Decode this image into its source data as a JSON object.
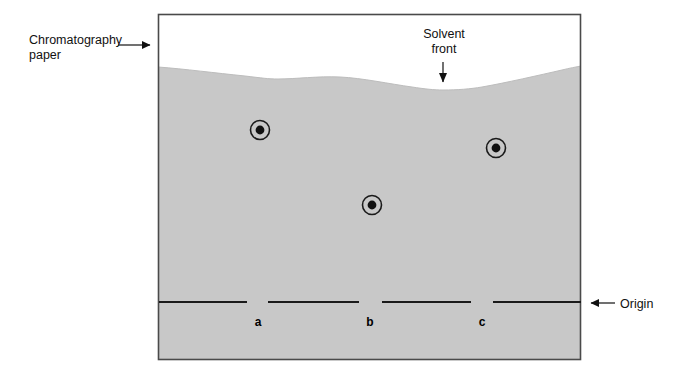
{
  "figure": {
    "type": "diagram",
    "canvas": {
      "width": 681,
      "height": 378,
      "background": "#ffffff"
    },
    "paper": {
      "name": "Chromatography paper",
      "frame": {
        "x": 158,
        "y": 14,
        "width": 423,
        "height": 346
      },
      "border_color": "#4a4a4a",
      "dry_color": "#ffffff",
      "wet_color": "#c8c8c8"
    },
    "solvent_front": {
      "label": "Solvent front",
      "description": "Wavy grey boundary marking how far the solvent travelled up the paper",
      "curve_points": [
        {
          "x": 158,
          "y": 67
        },
        {
          "x": 200,
          "y": 71
        },
        {
          "x": 245,
          "y": 76
        },
        {
          "x": 275,
          "y": 79
        },
        {
          "x": 310,
          "y": 77
        },
        {
          "x": 340,
          "y": 77
        },
        {
          "x": 375,
          "y": 81
        },
        {
          "x": 410,
          "y": 87
        },
        {
          "x": 443,
          "y": 90
        },
        {
          "x": 480,
          "y": 88
        },
        {
          "x": 520,
          "y": 80
        },
        {
          "x": 555,
          "y": 72
        },
        {
          "x": 581,
          "y": 67
        }
      ]
    },
    "origin": {
      "label": "Origin",
      "description": "Pencil baseline where the samples were spotted",
      "y": 302,
      "color": "#1a1a1a",
      "segments": [
        {
          "x1": 159,
          "x2": 247
        },
        {
          "x1": 268,
          "x2": 359
        },
        {
          "x1": 382,
          "x2": 471
        },
        {
          "x1": 493,
          "x2": 581
        }
      ]
    },
    "spots": [
      {
        "lane": "a",
        "cx": 260,
        "cy": 130,
        "outer_radius": 10,
        "inner_radius": 4.5
      },
      {
        "lane": "b",
        "cx": 372,
        "cy": 205,
        "outer_radius": 10,
        "inner_radius": 4.5
      },
      {
        "lane": "c",
        "cx": 496,
        "cy": 148,
        "outer_radius": 10,
        "inner_radius": 4.5
      }
    ],
    "lane_labels": [
      {
        "id": "a",
        "text": "a",
        "x": 258,
        "y": 322
      },
      {
        "id": "b",
        "text": "b",
        "x": 370,
        "y": 322
      },
      {
        "id": "c",
        "text": "c",
        "x": 482,
        "y": 322
      }
    ],
    "callouts": [
      {
        "id": "chromatography-paper",
        "line1": "Chromatography",
        "line2": "paper",
        "arrow": {
          "direction": "right",
          "x1": 118,
          "y1": 45,
          "x2": 157,
          "y2": 45
        }
      },
      {
        "id": "solvent-front",
        "line1": "Solvent",
        "line2": "front",
        "arrow": {
          "direction": "down",
          "x1": 443,
          "y1": 60,
          "x2": 443,
          "y2": 90
        }
      },
      {
        "id": "origin",
        "line1": "Origin",
        "line2": "",
        "arrow": {
          "direction": "left",
          "x1": 615,
          "y1": 303,
          "x2": 583,
          "y2": 303
        }
      }
    ]
  }
}
